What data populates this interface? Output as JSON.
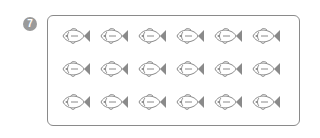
{
  "question": {
    "number": "7"
  },
  "fish_grid": {
    "rows": 3,
    "columns": 6,
    "total": 18,
    "icon": "fish-icon",
    "color": "#8a8a8a"
  }
}
